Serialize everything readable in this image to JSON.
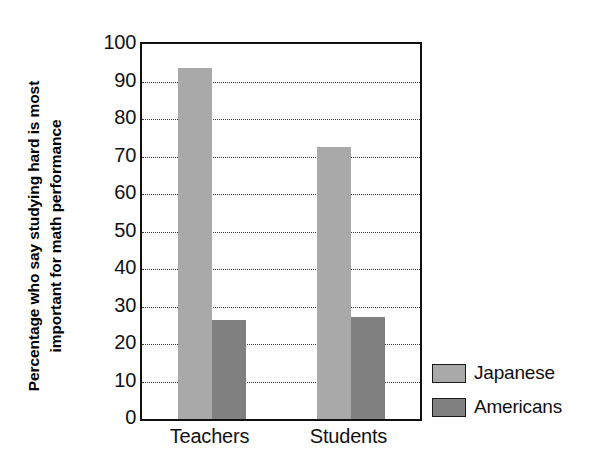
{
  "chart_data": {
    "type": "bar",
    "title": "",
    "xlabel": "",
    "ylabel_line1": "Percentage who say studying hard is most",
    "ylabel_line2": "important for math performance",
    "ylabel": "Percentage who say studying hard is most important for math performance",
    "categories": [
      "Teachers",
      "Students"
    ],
    "series": [
      {
        "name": "Japanese",
        "values": [
          93.5,
          72.5
        ],
        "color": "#a9a9a9"
      },
      {
        "name": "Americans",
        "values": [
          26.4,
          27.3
        ],
        "color": "#808080"
      }
    ],
    "ylim": [
      0,
      100
    ],
    "ytick_labels": [
      "100",
      "90",
      "80",
      "70",
      "60",
      "50",
      "40",
      "30",
      "20",
      "10",
      "0"
    ],
    "ytick_values": [
      100,
      90,
      80,
      70,
      60,
      50,
      40,
      30,
      20,
      10,
      0
    ],
    "ytick_step": 10,
    "grid": true,
    "grid_style": "dotted",
    "grid_color": "#3a3a3a",
    "legend_position": "right-bottom",
    "axis_color": "#111111",
    "background_color": "#ffffff"
  }
}
